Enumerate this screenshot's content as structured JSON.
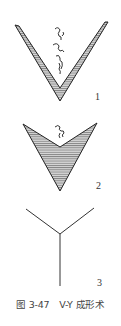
{
  "figure": {
    "panels": [
      {
        "id": "1",
        "label": "1",
        "description": "V-shaped incision with hatched margin"
      },
      {
        "id": "2",
        "label": "2",
        "description": "V-shaped flap advanced, hatched"
      },
      {
        "id": "3",
        "label": "3",
        "description": "Y-shaped closure suture line"
      }
    ],
    "caption": "图 3-47　V-Y 成形术"
  }
}
